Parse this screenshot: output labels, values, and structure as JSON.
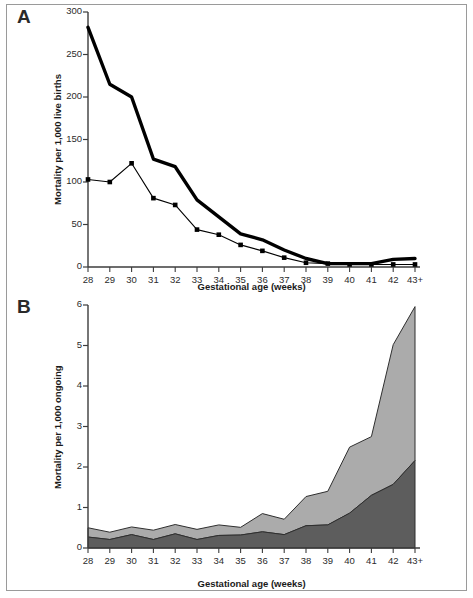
{
  "figure": {
    "panel_a_letter": "A",
    "panel_b_letter": "B"
  },
  "chart_data": [
    {
      "id": "panel-a",
      "type": "line",
      "title": "A",
      "xlabel": "Gestational age (weeks)",
      "ylabel": "Mortality per 1,000 live births",
      "categories": [
        "28",
        "29",
        "30",
        "31",
        "32",
        "33",
        "34",
        "35",
        "36",
        "37",
        "38",
        "39",
        "40",
        "41",
        "42",
        "43+"
      ],
      "xticklabels": [
        "28",
        "29",
        "30",
        "31",
        "32",
        "33",
        "34",
        "35",
        "36",
        "37",
        "38",
        "39",
        "40",
        "41",
        "42",
        "43+"
      ],
      "yticklabels": [
        "0",
        "50",
        "100",
        "150",
        "200",
        "250",
        "300"
      ],
      "yticks": [
        0,
        50,
        100,
        150,
        200,
        250,
        300
      ],
      "ylim": [
        0,
        300
      ],
      "grid": false,
      "legend": "none",
      "series": [
        {
          "name": "thick-line",
          "style": "thick-solid-no-marker",
          "color": "#000000",
          "linewidth": 3.4,
          "marker": "none",
          "values": [
            282,
            215,
            200,
            127,
            118,
            79,
            59,
            39,
            32,
            20,
            10,
            4,
            4,
            4,
            9,
            10
          ]
        },
        {
          "name": "thin-line-with-square-markers",
          "style": "thin-solid-square-marker",
          "color": "#000000",
          "linewidth": 1.1,
          "marker": "square",
          "values": [
            103,
            100,
            122,
            81,
            73,
            44,
            38,
            26,
            19,
            11,
            5,
            4,
            3,
            3,
            3,
            3
          ]
        }
      ]
    },
    {
      "id": "panel-b",
      "type": "area",
      "title": "B",
      "xlabel": "Gestational age (weeks)",
      "ylabel": "Mortality per 1,000 ongoing",
      "categories": [
        "28",
        "29",
        "30",
        "31",
        "32",
        "33",
        "34",
        "35",
        "36",
        "37",
        "38",
        "39",
        "40",
        "41",
        "42",
        "43+"
      ],
      "xticklabels": [
        "28",
        "29",
        "30",
        "31",
        "32",
        "33",
        "34",
        "35",
        "36",
        "37",
        "38",
        "39",
        "40",
        "41",
        "42",
        "43+"
      ],
      "yticklabels": [
        "0",
        "1",
        "2",
        "3",
        "4",
        "5",
        "6"
      ],
      "yticks": [
        0,
        1,
        2,
        3,
        4,
        5,
        6
      ],
      "ylim": [
        0,
        6
      ],
      "grid": false,
      "legend": "none",
      "stacked": true,
      "series": [
        {
          "name": "lower-band",
          "color": "#5d5d5d",
          "values": [
            0.27,
            0.21,
            0.33,
            0.21,
            0.35,
            0.21,
            0.31,
            0.32,
            0.4,
            0.33,
            0.55,
            0.57,
            0.86,
            1.3,
            1.57,
            2.16
          ]
        },
        {
          "name": "upper-band",
          "color": "#ababab",
          "values": [
            0.23,
            0.18,
            0.19,
            0.23,
            0.23,
            0.25,
            0.26,
            0.19,
            0.45,
            0.38,
            0.72,
            0.83,
            1.63,
            1.45,
            3.45,
            3.8
          ]
        }
      ],
      "totals": [
        0.5,
        0.39,
        0.52,
        0.44,
        0.58,
        0.46,
        0.57,
        0.51,
        0.85,
        0.71,
        1.27,
        1.4,
        2.49,
        2.75,
        5.02,
        5.96
      ]
    }
  ]
}
